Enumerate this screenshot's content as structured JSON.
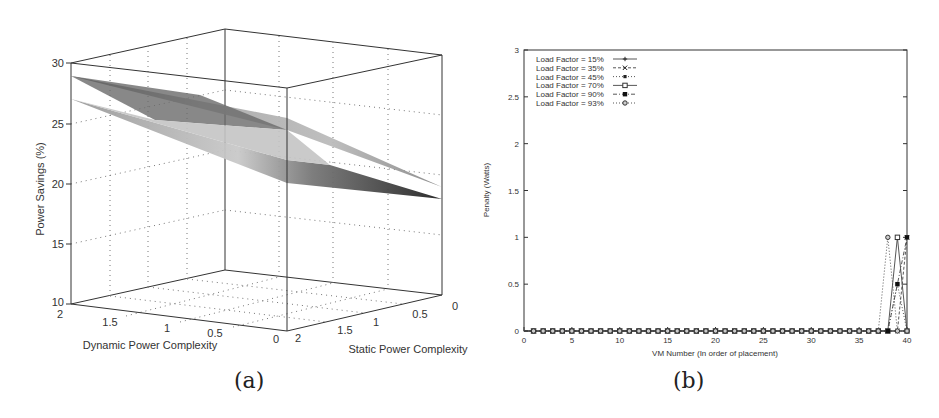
{
  "captions": {
    "a": "(a)",
    "b": "(b)"
  },
  "chart_data": [
    {
      "id": "a",
      "type": "surface3d",
      "title": "",
      "xlabel": "Dynamic Power Complexity",
      "ylabel": "Static Power Complexity",
      "zlabel": "Power Savings (%)",
      "x_ticks": [
        "2",
        "1.5",
        "1",
        "0.5",
        "0"
      ],
      "y_ticks": [
        "2",
        "1.5",
        "1",
        "0.5",
        "0"
      ],
      "z_ticks": [
        "10",
        "15",
        "20",
        "25",
        "30"
      ],
      "zlim": [
        10,
        30
      ],
      "grid": true,
      "series": [
        {
          "name": "upper surface",
          "corner_values": {
            "x2_y2": 29,
            "x0_y2": 24,
            "x2_y0": 26,
            "x0_y0": 19.6
          }
        },
        {
          "name": "lower surface",
          "corner_values": {
            "x2_y2": 27,
            "x0_y2": 20,
            "x2_y0": 24,
            "x0_y0": 18.6
          }
        }
      ]
    },
    {
      "id": "b",
      "type": "line",
      "title": "",
      "xlabel": "VM Number (In order of placement)",
      "ylabel": "Penalty (Watts)",
      "xlim": [
        0,
        40
      ],
      "ylim": [
        0,
        3
      ],
      "x_ticks": [
        "0",
        "5",
        "10",
        "15",
        "20",
        "25",
        "30",
        "35",
        "40"
      ],
      "y_ticks": [
        "0",
        "0.5",
        "1",
        "1.5",
        "2",
        "2.5",
        "3"
      ],
      "grid": false,
      "legend_position": "top-left",
      "x": [
        1,
        2,
        3,
        4,
        5,
        6,
        7,
        8,
        9,
        10,
        11,
        12,
        13,
        14,
        15,
        16,
        17,
        18,
        19,
        20,
        21,
        22,
        23,
        24,
        25,
        26,
        27,
        28,
        29,
        30,
        31,
        32,
        33,
        34,
        35,
        36,
        37,
        38,
        39,
        40
      ],
      "series": [
        {
          "name": "Load Factor = 15%",
          "marker": "+",
          "dash": "solid",
          "nonzero": {}
        },
        {
          "name": "Load Factor = 35%",
          "marker": "x",
          "dash": "dashed",
          "nonzero": {
            "40": 1
          }
        },
        {
          "name": "Load Factor = 45%",
          "marker": "filled-square-small",
          "dash": "dotted",
          "nonzero": {
            "39": 0.5
          }
        },
        {
          "name": "Load Factor = 70%",
          "marker": "open-square",
          "dash": "solid",
          "nonzero": {
            "39": 1
          }
        },
        {
          "name": "Load Factor = 90%",
          "marker": "filled-square",
          "dash": "dashdot",
          "nonzero": {
            "39": 0.5,
            "40": 1
          }
        },
        {
          "name": "Load Factor = 93%",
          "marker": "open-circle",
          "dash": "dotted",
          "nonzero": {
            "38": 1
          }
        }
      ]
    }
  ]
}
